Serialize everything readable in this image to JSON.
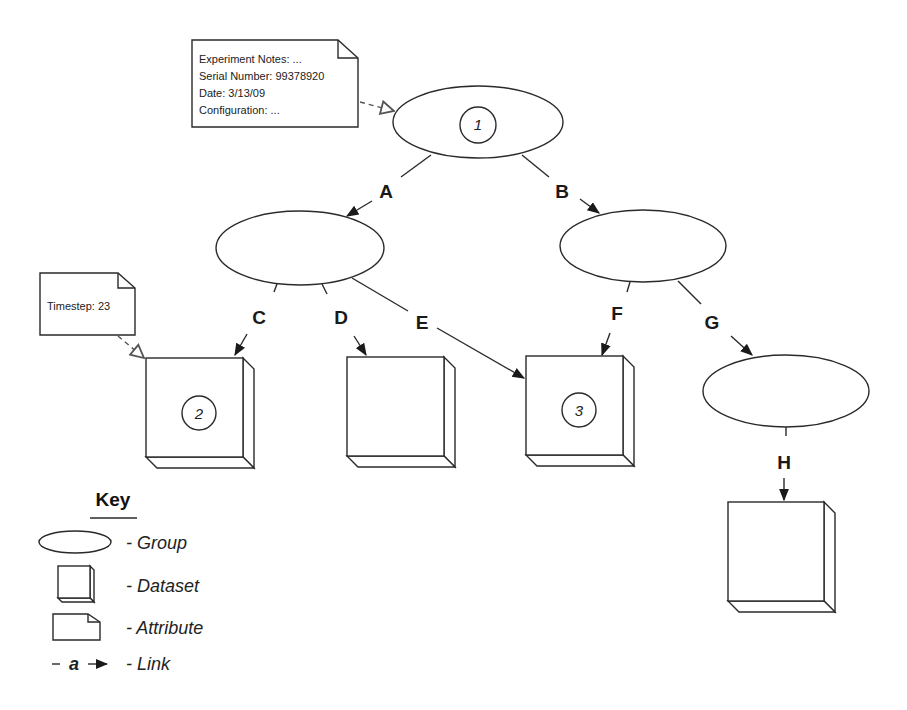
{
  "diagram": {
    "type": "hdf5-style hierarchy",
    "attributes": {
      "root_note": {
        "lines": [
          "Experiment Notes: ...",
          "Serial Number: 99378920",
          "Date: 3/13/09",
          "Configuration: ..."
        ]
      },
      "dataset_note": {
        "lines": [
          "Timestep: 23"
        ]
      }
    },
    "groups": [
      {
        "id": "root",
        "number": "1"
      },
      {
        "id": "group-a",
        "number": ""
      },
      {
        "id": "group-b",
        "number": ""
      },
      {
        "id": "group-g",
        "number": ""
      }
    ],
    "datasets": [
      {
        "id": "dataset-c",
        "number": "2"
      },
      {
        "id": "dataset-d",
        "number": ""
      },
      {
        "id": "dataset-ef",
        "number": "3"
      },
      {
        "id": "dataset-h",
        "number": ""
      }
    ],
    "links": [
      {
        "label": "A",
        "from": "root",
        "to": "group-a"
      },
      {
        "label": "B",
        "from": "root",
        "to": "group-b"
      },
      {
        "label": "C",
        "from": "group-a",
        "to": "dataset-c"
      },
      {
        "label": "D",
        "from": "group-a",
        "to": "dataset-d"
      },
      {
        "label": "E",
        "from": "group-a",
        "to": "dataset-ef"
      },
      {
        "label": "F",
        "from": "group-b",
        "to": "dataset-ef"
      },
      {
        "label": "G",
        "from": "group-b",
        "to": "group-g"
      },
      {
        "label": "H",
        "from": "group-g",
        "to": "dataset-h"
      }
    ]
  },
  "key": {
    "title": "Key",
    "items": [
      {
        "symbol": "ellipse",
        "label": "- Group"
      },
      {
        "symbol": "box",
        "label": "- Dataset"
      },
      {
        "symbol": "note",
        "label": "- Attribute"
      },
      {
        "symbol": "arrow",
        "symbol_text": "a",
        "label": "- Link"
      }
    ]
  }
}
